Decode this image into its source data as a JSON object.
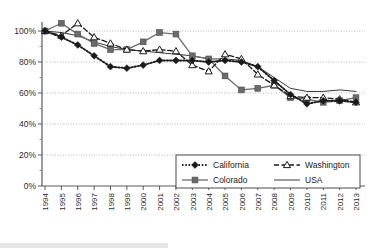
{
  "chart_data": {
    "type": "line",
    "title": "",
    "xlabel": "",
    "ylabel": "",
    "grid": true,
    "legend_position": "inside-bottom-right",
    "ylim": [
      0,
      110
    ],
    "ytick_values": [
      0,
      20,
      40,
      60,
      80,
      100
    ],
    "ytick_labels": [
      "0%",
      "20%",
      "40%",
      "60%",
      "80%",
      "100%"
    ],
    "x": [
      1994,
      1995,
      1996,
      1997,
      1998,
      1999,
      2000,
      2001,
      2002,
      2003,
      2004,
      2005,
      2006,
      2007,
      2008,
      2009,
      2010,
      2011,
      2012,
      2013
    ],
    "xtick_labels": [
      "1994",
      "1995",
      "1996",
      "1997",
      "1998",
      "1999",
      "2000",
      "2001",
      "2002",
      "2003",
      "2004",
      "2005",
      "2006",
      "2007",
      "2008",
      "2009",
      "2010",
      "2011",
      "2012",
      "2013"
    ],
    "series": [
      {
        "name": "California",
        "marker": "filled-diamond",
        "line_style": "dotted",
        "color": "#1a1a1a",
        "values": [
          100,
          96,
          91,
          84,
          77,
          76,
          78,
          81,
          81,
          81,
          80,
          81,
          80,
          77,
          68,
          59,
          53,
          55,
          55,
          54
        ]
      },
      {
        "name": "Colorado",
        "marker": "filled-square",
        "line_style": "solid",
        "color": "#6b6b6b",
        "values": [
          100,
          105,
          98,
          92,
          88,
          88,
          93,
          99,
          98,
          84,
          82,
          71,
          62,
          63,
          65,
          57,
          56,
          54,
          55,
          57
        ]
      },
      {
        "name": "Washington",
        "marker": "open-triangle",
        "line_style": "dashed",
        "color": "#1a1a1a",
        "values": [
          100,
          97,
          105,
          96,
          92,
          88,
          87,
          88,
          87,
          78,
          74,
          85,
          82,
          72,
          65,
          58,
          57,
          57,
          56,
          54
        ]
      },
      {
        "name": "USA",
        "marker": "none",
        "line_style": "solid-thin",
        "color": "#3a3a3a",
        "values": [
          100,
          99,
          97,
          93,
          90,
          88,
          87,
          86,
          85,
          84,
          82,
          82,
          81,
          77,
          70,
          63,
          61,
          61,
          62,
          61
        ]
      }
    ]
  },
  "legend": {
    "entries": [
      {
        "label": "California"
      },
      {
        "label": "Washington"
      },
      {
        "label": "Colorado"
      },
      {
        "label": "USA"
      }
    ]
  },
  "caption_fragment": ""
}
